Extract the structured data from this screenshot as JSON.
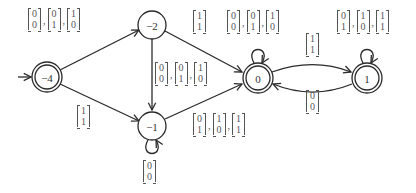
{
  "diagram": {
    "type": "state-automaton",
    "nodes": [
      {
        "id": "n_m4",
        "label": "−4",
        "x": 47,
        "y": 77,
        "accepting": true,
        "initial": true
      },
      {
        "id": "n_m2",
        "label": "−2",
        "x": 152,
        "y": 25,
        "accepting": false,
        "initial": false
      },
      {
        "id": "n_m1",
        "label": "−1",
        "x": 152,
        "y": 126,
        "accepting": false,
        "initial": false
      },
      {
        "id": "n_0",
        "label": "0",
        "x": 258,
        "y": 78,
        "accepting": true,
        "initial": false
      },
      {
        "id": "n_1",
        "label": "1",
        "x": 367,
        "y": 78,
        "accepting": true,
        "initial": false
      }
    ],
    "edges": [
      {
        "from": "−4",
        "to": "−2",
        "label": [
          [
            "0",
            "0"
          ],
          [
            "0",
            "1"
          ],
          [
            "1",
            "0"
          ]
        ]
      },
      {
        "from": "−4",
        "to": "−1",
        "label": [
          [
            "1",
            "1"
          ]
        ]
      },
      {
        "from": "−2",
        "to": "0",
        "label": [
          [
            "1",
            "1"
          ]
        ]
      },
      {
        "from": "−2",
        "to": "−1",
        "label": [
          [
            "0",
            "0"
          ],
          [
            "0",
            "1"
          ],
          [
            "1",
            "0"
          ]
        ]
      },
      {
        "from": "−1",
        "to": "0",
        "label": [
          [
            "0",
            "1"
          ],
          [
            "1",
            "0"
          ],
          [
            "1",
            "1"
          ]
        ]
      },
      {
        "from": "−1",
        "to": "−1",
        "label": [
          [
            "0",
            "0"
          ]
        ]
      },
      {
        "from": "0",
        "to": "0",
        "label": [
          [
            "0",
            "0"
          ],
          [
            "0",
            "1"
          ],
          [
            "1",
            "0"
          ]
        ]
      },
      {
        "from": "0",
        "to": "1",
        "label": [
          [
            "1",
            "1"
          ]
        ]
      },
      {
        "from": "1",
        "to": "0",
        "label": [
          [
            "0",
            "0"
          ]
        ]
      },
      {
        "from": "1",
        "to": "1",
        "label": [
          [
            "0",
            "1"
          ],
          [
            "1",
            "0"
          ],
          [
            "1",
            "1"
          ]
        ]
      }
    ],
    "labels": {
      "e_m4_m2": {
        "x": 28,
        "y": 8,
        "vectors": [
          [
            "0",
            "0"
          ],
          [
            "0",
            "1"
          ],
          [
            "1",
            "0"
          ]
        ]
      },
      "e_m4_m1": {
        "x": 77,
        "y": 105,
        "vectors": [
          [
            "1",
            "1"
          ]
        ]
      },
      "e_m2_0": {
        "x": 193,
        "y": 10,
        "vectors": [
          [
            "1",
            "1"
          ]
        ]
      },
      "e_m2_m1": {
        "x": 155,
        "y": 62,
        "vectors": [
          [
            "0",
            "0"
          ],
          [
            "0",
            "1"
          ],
          [
            "1",
            "0"
          ]
        ]
      },
      "e_m1_0": {
        "x": 193,
        "y": 113,
        "vectors": [
          [
            "0",
            "1"
          ],
          [
            "1",
            "0"
          ],
          [
            "1",
            "1"
          ]
        ]
      },
      "e_m1_m1": {
        "x": 143,
        "y": 160,
        "vectors": [
          [
            "0",
            "0"
          ]
        ]
      },
      "e_0_0": {
        "x": 227,
        "y": 10,
        "vectors": [
          [
            "0",
            "0"
          ],
          [
            "0",
            "1"
          ],
          [
            "1",
            "0"
          ]
        ]
      },
      "e_0_1": {
        "x": 306,
        "y": 33,
        "vectors": [
          [
            "1",
            "1"
          ]
        ]
      },
      "e_1_0": {
        "x": 306,
        "y": 90,
        "vectors": [
          [
            "0",
            "0"
          ]
        ]
      },
      "e_1_1": {
        "x": 337,
        "y": 10,
        "vectors": [
          [
            "0",
            "1"
          ],
          [
            "1",
            "0"
          ],
          [
            "1",
            "1"
          ]
        ]
      }
    }
  }
}
